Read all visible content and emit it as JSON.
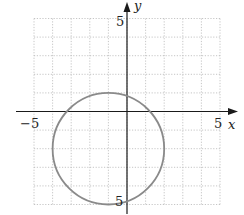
{
  "chart_data": {
    "type": "line",
    "title": "",
    "xlabel": "x",
    "ylabel": "y",
    "xlim": [
      -5,
      5
    ],
    "ylim": [
      -5,
      5
    ],
    "grid": true,
    "grid_style": "dotted",
    "x_tick_labels": [
      "-5",
      "5"
    ],
    "y_tick_labels": [
      "5",
      "-5"
    ],
    "series": [
      {
        "name": "circle",
        "shape": "circle",
        "center": [
          -1,
          -2
        ],
        "radius": 3,
        "equation": "(x+1)^2 + (y+2)^2 = 9",
        "color": "#8a8a8a"
      }
    ]
  },
  "labels": {
    "x_axis": "x",
    "y_axis": "y",
    "x_min": "−5",
    "x_max": "5",
    "y_max": "5",
    "y_min": "5"
  },
  "colors": {
    "axis": "#1a1a1a",
    "grid": "#b8b8b8",
    "curve": "#8a8a8a"
  }
}
